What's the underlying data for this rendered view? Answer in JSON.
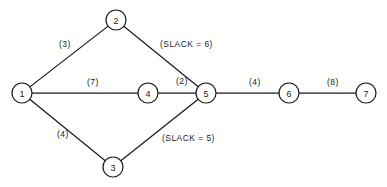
{
  "diagram": {
    "type": "activity-network-diagram",
    "title": "",
    "canvas": {
      "width": 387,
      "height": 187,
      "background": "#ffffff"
    },
    "style": {
      "line_color": "#1a1a1a",
      "node_fill": "#ffffff",
      "node_radius": 10
    },
    "nodes": [
      {
        "id": "1",
        "label": "1",
        "x": 22,
        "y": 93
      },
      {
        "id": "2",
        "label": "2",
        "x": 116,
        "y": 20
      },
      {
        "id": "3",
        "label": "3",
        "x": 113,
        "y": 167
      },
      {
        "id": "4",
        "label": "4",
        "x": 148,
        "y": 93
      },
      {
        "id": "5",
        "label": "5",
        "x": 206,
        "y": 93
      },
      {
        "id": "6",
        "label": "6",
        "x": 289,
        "y": 93
      },
      {
        "id": "7",
        "label": "7",
        "x": 366,
        "y": 93
      }
    ],
    "edges": [
      {
        "id": "e-1-2",
        "from": "1",
        "to": "2",
        "label": "(3)",
        "label_x": 59,
        "label_y": 47
      },
      {
        "id": "e-2-5",
        "from": "2",
        "to": "5",
        "label": "(SLACK = 6)",
        "label_x": 160,
        "label_y": 47
      },
      {
        "id": "e-1-4",
        "from": "1",
        "to": "4",
        "label": "(7)",
        "label_x": 87,
        "label_y": 85
      },
      {
        "id": "e-4-5",
        "from": "4",
        "to": "5",
        "label": "(2)",
        "label_x": 176,
        "label_y": 84
      },
      {
        "id": "e-1-3",
        "from": "1",
        "to": "3",
        "label": "(4)",
        "label_x": 57,
        "label_y": 137
      },
      {
        "id": "e-3-5",
        "from": "3",
        "to": "5",
        "label": "(SLACK = 5)",
        "label_x": 162,
        "label_y": 141
      },
      {
        "id": "e-5-6",
        "from": "5",
        "to": "6",
        "label": "(4)",
        "label_x": 249,
        "label_y": 85
      },
      {
        "id": "e-6-7",
        "from": "6",
        "to": "7",
        "label": "(8)",
        "label_x": 327,
        "label_y": 85
      }
    ]
  }
}
